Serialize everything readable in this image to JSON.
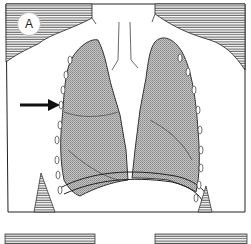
{
  "figure": {
    "panel_label": "A",
    "annotations": [
      {
        "type": "arrow",
        "direction": "right",
        "target": "right-lateral-pleura"
      }
    ],
    "colors": {
      "line": "#222222",
      "lung_fill": "#b8b8b8",
      "hatch": "#555555",
      "background": "#ffffff"
    }
  }
}
